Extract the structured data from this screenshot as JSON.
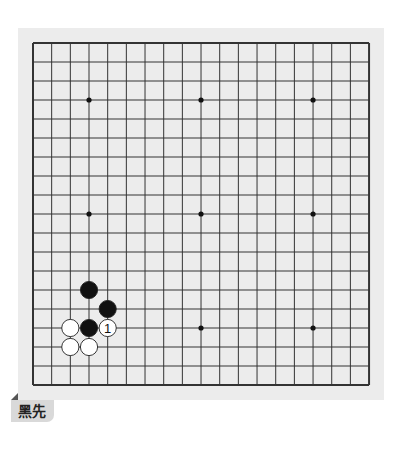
{
  "board": {
    "size": 19,
    "origin_x": 33,
    "origin_y": 43,
    "spacing_x": 18.67,
    "spacing_y": 19,
    "line_color": "#333333",
    "background_color": "#ececec",
    "star_points": [
      [
        3,
        3
      ],
      [
        9,
        3
      ],
      [
        15,
        3
      ],
      [
        3,
        9
      ],
      [
        9,
        9
      ],
      [
        15,
        9
      ],
      [
        3,
        15
      ],
      [
        9,
        15
      ],
      [
        15,
        15
      ]
    ],
    "stones": [
      {
        "col": 3,
        "row": 13,
        "color": "black"
      },
      {
        "col": 4,
        "row": 14,
        "color": "black"
      },
      {
        "col": 3,
        "row": 15,
        "color": "black"
      },
      {
        "col": 4,
        "row": 15,
        "color": "white",
        "label": "1"
      },
      {
        "col": 2,
        "row": 15,
        "color": "white"
      },
      {
        "col": 2,
        "row": 16,
        "color": "white"
      },
      {
        "col": 3,
        "row": 16,
        "color": "white"
      }
    ]
  },
  "caption": {
    "text": "黑先"
  }
}
